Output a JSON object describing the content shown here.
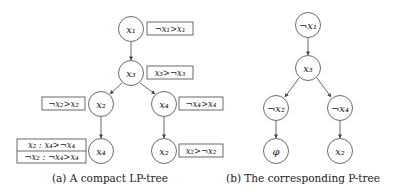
{
  "figures": {
    "a": {
      "caption": "(a) A compact LP-tree",
      "nodes": [
        {
          "id": "a_x1",
          "label": "x₁",
          "cx": 131,
          "cy": 29
        },
        {
          "id": "a_x3",
          "label": "x₃",
          "cx": 131,
          "cy": 73
        },
        {
          "id": "a_x2",
          "label": "x₂",
          "cx": 101,
          "cy": 104
        },
        {
          "id": "a_x4",
          "label": "x₄",
          "cx": 164,
          "cy": 104
        },
        {
          "id": "a_x4b",
          "label": "x₄",
          "cx": 101,
          "cy": 151
        },
        {
          "id": "a_x2b",
          "label": "x₂",
          "cx": 164,
          "cy": 151
        }
      ],
      "preference_tables": {
        "x1": "¬x₁>x₁",
        "x3": "x₃>¬x₃",
        "x2": "¬x₂>x₂",
        "x4": "¬x₄>x₄",
        "x4_bottom_row1": "x₂ : x₄>¬x₄",
        "x4_bottom_row2": "¬x₂ : ¬x₄>x₄",
        "x2_bottom": "x₂>¬x₂"
      }
    },
    "b": {
      "caption": "(b) The corresponding P-tree",
      "nodes": {
        "n1": "¬x₁",
        "n3": "x₃",
        "n2": "¬x₂",
        "n4": "¬x₄",
        "phi": "φ",
        "n2b": "x₂"
      }
    }
  }
}
